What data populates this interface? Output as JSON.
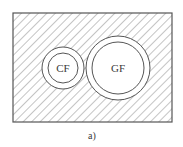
{
  "figure": {
    "caption": "a)",
    "colors": {
      "stroke": "#555555",
      "hatch": "#8a8a8a",
      "background": "#ffffff",
      "text": "#3a3a3a"
    },
    "region": {
      "x": 13,
      "y": 13,
      "width": 159,
      "height": 109,
      "fill": "diagonal-hatch"
    },
    "circles": [
      {
        "label": "CF",
        "cx": 63,
        "cy": 68,
        "outer_r": 21,
        "inner_r": 15
      },
      {
        "label": "GF",
        "cx": 118,
        "cy": 68,
        "outer_r": 32,
        "inner_r": 26
      }
    ]
  }
}
